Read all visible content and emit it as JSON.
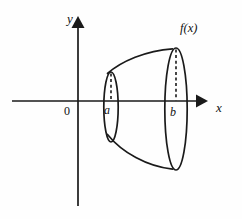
{
  "figure": {
    "kind": "solid-of-revolution-diagram",
    "background_color": "#fefefe",
    "ink_color": "#1a1a1a",
    "axes": {
      "x_axis_label": "x",
      "y_axis_label": "y",
      "origin_label": "0",
      "x_axis_y_pixel": 101,
      "y_axis_x_pixel": 78,
      "x_axis_start": 12,
      "x_axis_end": 206,
      "y_axis_top": 18,
      "y_axis_bottom": 206,
      "arrowheads": [
        "x-axis-right",
        "y-axis-up"
      ]
    },
    "curve": {
      "function_label": "f(x)",
      "function_label_italic_part": "f",
      "function_label_variable": "x",
      "left_bound_label": "a",
      "right_bound_label": "b",
      "left_bound_x_pixel": 111,
      "right_bound_x_pixel": 176,
      "top_curve_start": [
        107,
        73
      ],
      "top_curve_end": [
        172,
        49
      ],
      "bottom_curve_start": [
        107,
        135
      ],
      "bottom_curve_end": [
        172,
        168
      ]
    },
    "disks": [
      {
        "name": "disk-at-a",
        "center_x": 111,
        "center_y": 107,
        "radius_x": 7,
        "radius_y": 35,
        "hidden_edge": "dashed-vertical-radius"
      },
      {
        "name": "disk-at-b",
        "center_x": 176,
        "center_y": 109,
        "radius_x": 11,
        "radius_y": 61,
        "hidden_edge": "dashed-vertical-radius"
      }
    ]
  }
}
